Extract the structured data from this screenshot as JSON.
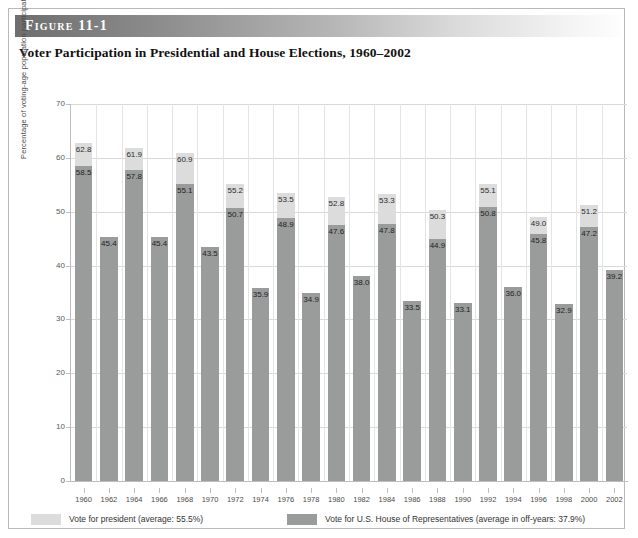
{
  "figure": {
    "banner_label": "Figure 11-1",
    "title": "Voter Participation in Presidential and House Elections, 1960–2002"
  },
  "legend": {
    "president_label": "Vote for president (average: 55.5%)",
    "house_label": "Vote for U.S. House of Representatives (average in off-years: 37.9%)",
    "president_color": "#dcdcdc",
    "house_color": "#9a9b9b"
  },
  "chart_data": {
    "type": "bar",
    "title": "Voter Participation in Presidential and House Elections, 1960–2002",
    "xlabel": "",
    "ylabel": "Percentage of voting-age population participating",
    "ylim": [
      0,
      70
    ],
    "yticks": [
      0,
      10,
      20,
      30,
      40,
      50,
      60,
      70
    ],
    "grid": true,
    "legend_position": "bottom",
    "stacked": true,
    "categories": [
      "1960",
      "1962",
      "1964",
      "1966",
      "1968",
      "1970",
      "1972",
      "1974",
      "1976",
      "1978",
      "1980",
      "1982",
      "1984",
      "1986",
      "1988",
      "1990",
      "1992",
      "1994",
      "1996",
      "1998",
      "2000",
      "2002"
    ],
    "series": [
      {
        "name": "Vote for president (average: 55.5%)",
        "color": "#dcdcdc",
        "values": [
          62.8,
          null,
          61.9,
          null,
          60.9,
          null,
          55.2,
          null,
          53.5,
          null,
          52.8,
          null,
          53.3,
          null,
          50.3,
          null,
          55.1,
          null,
          49.0,
          null,
          51.2,
          null
        ]
      },
      {
        "name": "Vote for U.S. House of Representatives (average in off-years: 37.9%)",
        "color": "#9a9b9b",
        "values": [
          58.5,
          45.4,
          57.8,
          45.4,
          55.1,
          43.5,
          50.7,
          35.9,
          48.9,
          34.9,
          47.6,
          38.0,
          47.8,
          33.5,
          44.9,
          33.1,
          50.8,
          36.0,
          45.8,
          32.9,
          47.2,
          39.2
        ]
      }
    ],
    "bars": [
      {
        "year": "1960",
        "president": 62.8,
        "house": 58.5
      },
      {
        "year": "1962",
        "president": null,
        "house": 45.4
      },
      {
        "year": "1964",
        "president": 61.9,
        "house": 57.8
      },
      {
        "year": "1966",
        "president": null,
        "house": 45.4
      },
      {
        "year": "1968",
        "president": 60.9,
        "house": 55.1
      },
      {
        "year": "1970",
        "president": null,
        "house": 43.5
      },
      {
        "year": "1972",
        "president": 55.2,
        "house": 50.7
      },
      {
        "year": "1974",
        "president": null,
        "house": 35.9
      },
      {
        "year": "1976",
        "president": 53.5,
        "house": 48.9
      },
      {
        "year": "1978",
        "president": null,
        "house": 34.9
      },
      {
        "year": "1980",
        "president": 52.8,
        "house": 47.6
      },
      {
        "year": "1982",
        "president": null,
        "house": 38.0
      },
      {
        "year": "1984",
        "president": 53.3,
        "house": 47.8
      },
      {
        "year": "1986",
        "president": null,
        "house": 33.5
      },
      {
        "year": "1988",
        "president": 50.3,
        "house": 44.9
      },
      {
        "year": "1990",
        "president": null,
        "house": 33.1
      },
      {
        "year": "1992",
        "president": 55.1,
        "house": 50.8
      },
      {
        "year": "1994",
        "president": null,
        "house": 36.0
      },
      {
        "year": "1996",
        "president": 49.0,
        "house": 45.8
      },
      {
        "year": "1998",
        "president": null,
        "house": 32.9
      },
      {
        "year": "2000",
        "president": 51.2,
        "house": 47.2
      },
      {
        "year": "2002",
        "president": null,
        "house": 39.2
      }
    ]
  }
}
